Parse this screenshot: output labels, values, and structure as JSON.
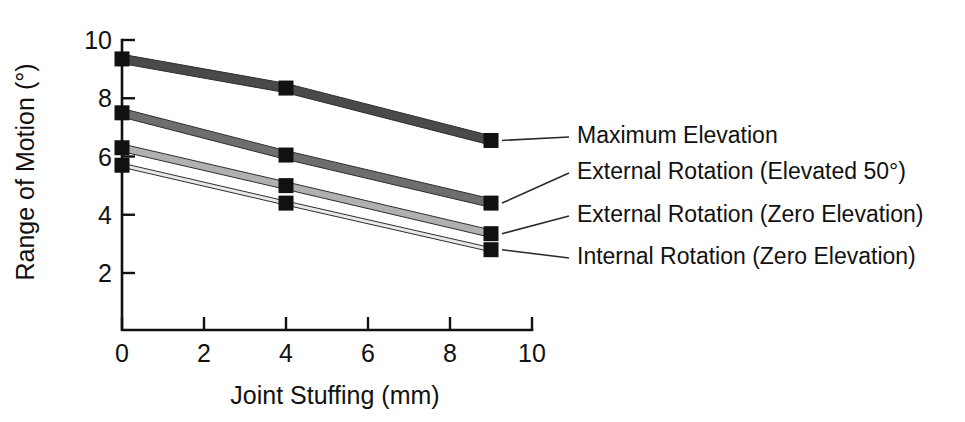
{
  "chart_data": {
    "type": "line",
    "title": "",
    "subtitle": "",
    "xlabel": "Joint Stuffing (mm)",
    "ylabel": "Range of Motion (°)",
    "xlim": [
      0,
      10
    ],
    "ylim": [
      0,
      10
    ],
    "xticks": [
      0,
      2,
      4,
      6,
      8,
      10
    ],
    "yticks": [
      2,
      4,
      6,
      8,
      10
    ],
    "xtick_labels": [
      "0",
      "2",
      "4",
      "6",
      "8",
      "10"
    ],
    "ytick_labels": [
      "2",
      "4",
      "6",
      "8",
      "10"
    ],
    "grid": false,
    "legend_position": "right-inline-labels",
    "marker": "square",
    "x": [
      0,
      4,
      9
    ],
    "series": [
      {
        "name": "Maximum Elevation",
        "values": [
          9.35,
          8.35,
          6.55
        ],
        "color": "#4a4a4a",
        "band_width_units": 0.32
      },
      {
        "name": "External Rotation (Elevated 50°)",
        "values": [
          7.5,
          6.05,
          4.4
        ],
        "color": "#6e6e6e",
        "band_width_units": 0.3
      },
      {
        "name": "External Rotation (Zero Elevation)",
        "values": [
          6.3,
          5.0,
          3.35
        ],
        "color": "#b0b0b0",
        "band_width_units": 0.26
      },
      {
        "name": "Internal Rotation (Zero Elevation)",
        "values": [
          5.7,
          4.4,
          2.8
        ],
        "color": "#e8e8e8",
        "band_width_units": 0.14
      }
    ]
  },
  "legend": {
    "entries": [
      {
        "label": "Maximum Elevation"
      },
      {
        "label": "External Rotation (Elevated 50°)"
      },
      {
        "label": "External Rotation (Zero Elevation)"
      },
      {
        "label": "Internal Rotation (Zero Elevation)"
      }
    ]
  },
  "axes": {
    "y_title": "Range of Motion (°)",
    "x_title": "Joint Stuffing (mm)"
  }
}
